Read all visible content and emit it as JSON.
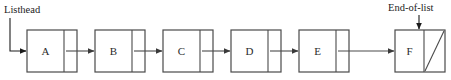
{
  "diagram": {
    "annotations": {
      "listhead": {
        "label": "Listhead",
        "x": 4,
        "y": 13,
        "points_to": "A"
      },
      "end_of_list": {
        "label": "End-of-list",
        "x": 388,
        "y": 11,
        "points_to": "F"
      }
    },
    "geometry": {
      "box_top": 30,
      "box_height": 42,
      "box_width": 50,
      "box_pitch": 68,
      "first_box_x": 27,
      "divider_offset": 37,
      "mid_y": 51
    },
    "colors": {
      "stroke": "#4a4a4a",
      "text": "#2b2b2b",
      "annotation": "#1c1c1c",
      "background": "#ffffff"
    },
    "nodes": [
      {
        "id": "node-a",
        "label": "A",
        "x": 27,
        "next": "B",
        "null_pointer": false
      },
      {
        "id": "node-b",
        "label": "B",
        "x": 95,
        "next": "C",
        "null_pointer": false
      },
      {
        "id": "node-c",
        "label": "C",
        "x": 163,
        "next": "D",
        "null_pointer": false
      },
      {
        "id": "node-d",
        "label": "D",
        "x": 231,
        "next": "E",
        "null_pointer": false
      },
      {
        "id": "node-e",
        "label": "E",
        "x": 299,
        "next": "F",
        "null_pointer": false
      },
      {
        "id": "node-f",
        "label": "F",
        "x": 395,
        "next": null,
        "null_pointer": true
      }
    ]
  }
}
